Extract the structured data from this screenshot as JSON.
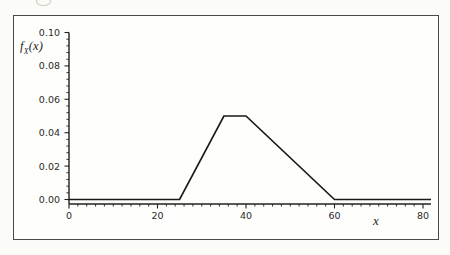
{
  "figure": {
    "ylabel": {
      "base": "f",
      "sub": "X",
      "args": "(x)"
    },
    "xlabel": "x"
  },
  "colors": {
    "line": "#1a1a1a",
    "axis": "#222220",
    "frame_border": "#4a4a48",
    "text": "#2b2b2b"
  },
  "chart_data": {
    "type": "line",
    "title": "",
    "xlabel": "x",
    "ylabel": "f_X(x)",
    "xlim": [
      0,
      80
    ],
    "ylim": [
      0,
      0.1
    ],
    "x_ticks": [
      0,
      20,
      40,
      60,
      80
    ],
    "x_tick_labels": [
      "0",
      "20",
      "40",
      "60",
      "80"
    ],
    "x_minor_step": 2,
    "y_ticks": [
      0,
      0.02,
      0.04,
      0.06,
      0.08,
      0.1
    ],
    "y_tick_labels": [
      "0.00",
      "0.02",
      "0.04",
      "0.06",
      "0.08",
      "0.10"
    ],
    "y_minor_step": 0.004,
    "grid": false,
    "series": [
      {
        "name": "pdf-curve",
        "color": "#1a1a1a",
        "points": [
          [
            0,
            0
          ],
          [
            25,
            0
          ],
          [
            35,
            0.05
          ],
          [
            40,
            0.05
          ],
          [
            60,
            0
          ],
          [
            80,
            0
          ]
        ]
      }
    ]
  }
}
